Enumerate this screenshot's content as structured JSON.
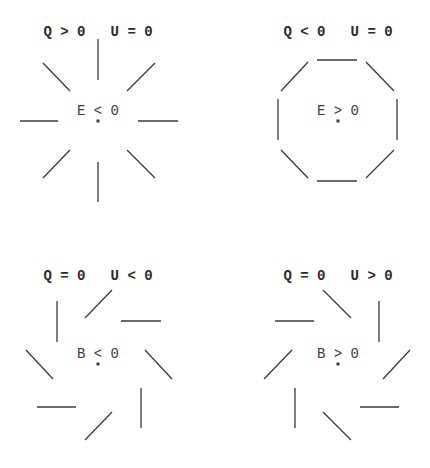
{
  "panels": [
    {
      "id": "top-left",
      "title": "Q > 0   U = 0",
      "center_label": "E < 0",
      "pattern": "radial",
      "center": [
        98,
        121
      ],
      "title_pos": [
        98,
        35
      ],
      "segments": [
        [
          98,
          39,
          98,
          80
        ],
        [
          43,
          63,
          70,
          91
        ],
        [
          155,
          63,
          127,
          91
        ],
        [
          20,
          121,
          58,
          121
        ],
        [
          138,
          121,
          178,
          121
        ],
        [
          70,
          150,
          43,
          178
        ],
        [
          127,
          150,
          155,
          178
        ],
        [
          98,
          162,
          98,
          202
        ]
      ]
    },
    {
      "id": "top-right",
      "title": "Q < 0   U = 0",
      "center_label": "E > 0",
      "pattern": "tangential",
      "center": [
        338,
        121
      ],
      "title_pos": [
        338,
        35
      ],
      "segments": [
        [
          317,
          60,
          357,
          60
        ],
        [
          308,
          62,
          281,
          91
        ],
        [
          366,
          62,
          394,
          91
        ],
        [
          278,
          99,
          278,
          140
        ],
        [
          397,
          99,
          397,
          140
        ],
        [
          281,
          150,
          308,
          178
        ],
        [
          394,
          150,
          366,
          178
        ],
        [
          317,
          181,
          357,
          181
        ]
      ]
    },
    {
      "id": "bottom-left",
      "title": "Q = 0   U < 0",
      "center_label": "B < 0",
      "pattern": "spiral-left",
      "center": [
        98,
        364
      ],
      "title_pos": [
        98,
        279
      ],
      "segments": [
        [
          57,
          301,
          57,
          342
        ],
        [
          112,
          290,
          85,
          318
        ],
        [
          121,
          321,
          161,
          321
        ],
        [
          26,
          350,
          53,
          379
        ],
        [
          145,
          350,
          172,
          379
        ],
        [
          37,
          407,
          76,
          407
        ],
        [
          141,
          388,
          141,
          428
        ],
        [
          112,
          412,
          85,
          440
        ]
      ]
    },
    {
      "id": "bottom-right",
      "title": "Q = 0   U > 0",
      "center_label": "B > 0",
      "pattern": "spiral-right",
      "center": [
        338,
        364
      ],
      "title_pos": [
        338,
        279
      ],
      "segments": [
        [
          323,
          290,
          351,
          318
        ],
        [
          379,
          301,
          379,
          342
        ],
        [
          275,
          321,
          314,
          321
        ],
        [
          292,
          350,
          264,
          379
        ],
        [
          410,
          350,
          383,
          379
        ],
        [
          295,
          388,
          295,
          428
        ],
        [
          360,
          407,
          399,
          407
        ],
        [
          323,
          412,
          351,
          440
        ]
      ]
    }
  ]
}
